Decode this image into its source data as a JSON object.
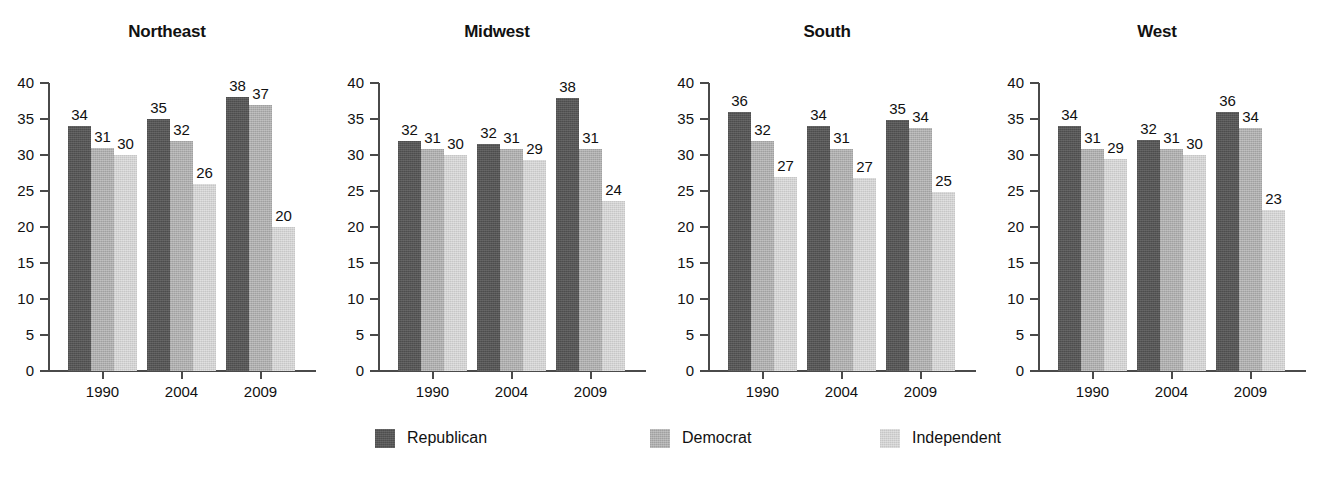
{
  "chart_data": {
    "type": "bar",
    "title": "",
    "xlabel": "",
    "ylabel": "",
    "ylim": [
      0,
      40
    ],
    "ytick_labels": [
      "0",
      "5",
      "10",
      "15",
      "20",
      "25",
      "30",
      "35",
      "40"
    ],
    "ytick_values": [
      0,
      5,
      10,
      15,
      20,
      25,
      30,
      35,
      40
    ],
    "grid": false,
    "categories": [
      "1990",
      "2004",
      "2009"
    ],
    "legend_position": "bottom",
    "series_names": [
      "Republican",
      "Democrat",
      "Independent"
    ],
    "series_colors": [
      "#565656",
      "#aeaeae",
      "#d2d2d2"
    ],
    "panels": [
      {
        "name": "Northeast",
        "series": [
          {
            "name": "Republican",
            "values": [
              34,
              35,
              38
            ],
            "drawn": [
              34.0,
              35.0,
              38.0
            ],
            "labels": [
              "34",
              "35",
              "38"
            ]
          },
          {
            "name": "Democrat",
            "values": [
              31,
              32,
              37
            ],
            "drawn": [
              31.0,
              32.0,
              37.0
            ],
            "labels": [
              "31",
              "32",
              "37"
            ]
          },
          {
            "name": "Independent",
            "values": [
              30,
              26,
              20
            ],
            "drawn": [
              30.0,
              26.0,
              20.0
            ],
            "labels": [
              "30",
              "26",
              "20"
            ]
          }
        ]
      },
      {
        "name": "Midwest",
        "series": [
          {
            "name": "Republican",
            "values": [
              32,
              32,
              38
            ],
            "drawn": [
              31.9,
              31.5,
              37.9
            ],
            "labels": [
              "32",
              "32",
              "38"
            ]
          },
          {
            "name": "Democrat",
            "values": [
              31,
              31,
              31
            ],
            "drawn": [
              30.9,
              30.8,
              30.8
            ],
            "labels": [
              "31",
              "31",
              "31"
            ]
          },
          {
            "name": "Independent",
            "values": [
              30,
              29,
              24
            ],
            "drawn": [
              30.0,
              29.3,
              23.6
            ],
            "labels": [
              "30",
              "29",
              "24"
            ]
          }
        ]
      },
      {
        "name": "South",
        "series": [
          {
            "name": "Republican",
            "values": [
              36,
              34,
              35
            ],
            "drawn": [
              36.0,
              34.0,
              34.9
            ],
            "labels": [
              "36",
              "34",
              "35"
            ]
          },
          {
            "name": "Democrat",
            "values": [
              32,
              31,
              34
            ],
            "drawn": [
              32.0,
              30.9,
              33.8
            ],
            "labels": [
              "32",
              "31",
              "34"
            ]
          },
          {
            "name": "Independent",
            "values": [
              27,
              27,
              25
            ],
            "drawn": [
              26.9,
              26.8,
              24.8
            ],
            "labels": [
              "27",
              "27",
              "25"
            ]
          }
        ]
      },
      {
        "name": "West",
        "series": [
          {
            "name": "Republican",
            "values": [
              34,
              32,
              36
            ],
            "drawn": [
              34.0,
              32.1,
              36.0
            ],
            "labels": [
              "34",
              "32",
              "36"
            ]
          },
          {
            "name": "Democrat",
            "values": [
              31,
              31,
              34
            ],
            "drawn": [
              30.9,
              30.8,
              33.8
            ],
            "labels": [
              "31",
              "31",
              "34"
            ]
          },
          {
            "name": "Independent",
            "values": [
              29,
              30,
              23
            ],
            "drawn": [
              29.4,
              30.0,
              22.4
            ],
            "labels": [
              "29",
              "30",
              "23"
            ]
          }
        ]
      }
    ]
  },
  "panels": [
    {
      "title": "Northeast"
    },
    {
      "title": "Midwest"
    },
    {
      "title": "South"
    },
    {
      "title": "West"
    }
  ],
  "legend": {
    "items": [
      {
        "label": "Republican",
        "key": "rep"
      },
      {
        "label": "Democrat",
        "key": "dem"
      },
      {
        "label": "Independent",
        "key": "ind"
      }
    ]
  }
}
